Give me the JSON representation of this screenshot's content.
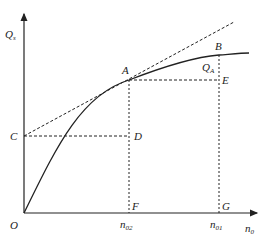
{
  "diagram": {
    "axes": {
      "y_label": "Q",
      "y_label_sub": "s",
      "x_label": "n",
      "x_label_sub": "0",
      "origin_label": "O"
    },
    "points": {
      "A": "A",
      "B": "B",
      "C": "C",
      "D": "D",
      "E": "E",
      "F": "F",
      "G": "G"
    },
    "annotations": {
      "qa_label": "Q",
      "qa_sub": "A",
      "n02_label": "n",
      "n02_sub": "02",
      "n01_label": "n",
      "n01_sub": "01"
    },
    "colors": {
      "line": "#222222",
      "background": "#ffffff"
    }
  }
}
